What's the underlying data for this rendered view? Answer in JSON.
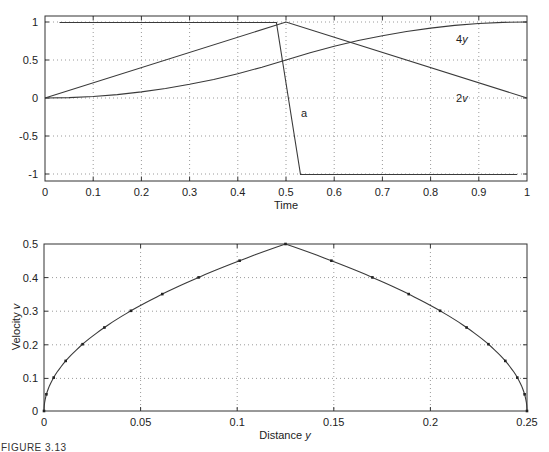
{
  "chart_data": [
    {
      "type": "line",
      "title": "",
      "xlabel": "Time",
      "ylabel": "",
      "xlim": [
        0,
        1
      ],
      "ylim": [
        -1.1,
        1.1
      ],
      "grid": true,
      "x_ticks": [
        "0",
        "0.1",
        "0.2",
        "0.3",
        "0.4",
        "0.5",
        "0.6",
        "0.7",
        "0.8",
        "0.9",
        "1"
      ],
      "y_ticks": [
        "1",
        "0.5",
        "0",
        "-0.5",
        "-1"
      ],
      "series": [
        {
          "name": "a",
          "x": [
            0.03,
            0.48,
            0.53,
            0.98
          ],
          "values": [
            1,
            1,
            -1,
            -1
          ]
        },
        {
          "name": "2v",
          "x": [
            0,
            0.5,
            1
          ],
          "values": [
            0,
            1,
            0
          ]
        },
        {
          "name": "4y",
          "x": [
            0,
            0.1,
            0.2,
            0.3,
            0.4,
            0.5,
            0.6,
            0.7,
            0.8,
            0.9,
            1
          ],
          "values": [
            0,
            0.02,
            0.08,
            0.18,
            0.32,
            0.5,
            0.68,
            0.82,
            0.92,
            0.98,
            1
          ]
        }
      ],
      "annotations": [
        {
          "text": "4y",
          "x": 0.88,
          "y": 0.8
        },
        {
          "text": "2v",
          "x": 0.88,
          "y": 0.05
        },
        {
          "text": "a",
          "x": 0.555,
          "y": -0.35
        }
      ]
    },
    {
      "type": "line",
      "title": "",
      "xlabel": "Distance y",
      "ylabel": "Velocity v",
      "xlim": [
        0,
        0.25
      ],
      "ylim": [
        0,
        0.5
      ],
      "grid": true,
      "markers": true,
      "x_ticks": [
        "0",
        "0.05",
        "0.1",
        "0.15",
        "0.2",
        "0.25"
      ],
      "y_ticks": [
        "0.5",
        "0.4",
        "0.3",
        "0.2",
        "0.1",
        "0"
      ],
      "series": [
        {
          "name": "velocity vs distance",
          "x": [
            0,
            0.00125,
            0.005,
            0.01125,
            0.02,
            0.03125,
            0.045,
            0.06125,
            0.08,
            0.10125,
            0.125,
            0.14875,
            0.17,
            0.18875,
            0.205,
            0.21875,
            0.23,
            0.23875,
            0.245,
            0.24875,
            0.25
          ],
          "values": [
            0,
            0.05,
            0.1,
            0.15,
            0.2,
            0.25,
            0.3,
            0.35,
            0.4,
            0.45,
            0.5,
            0.45,
            0.4,
            0.35,
            0.3,
            0.25,
            0.2,
            0.15,
            0.1,
            0.05,
            0
          ]
        }
      ]
    }
  ],
  "top_plot": {
    "xlabel": "Time",
    "x_ticks": [
      "0",
      "0.1",
      "0.2",
      "0.3",
      "0.4",
      "0.5",
      "0.6",
      "0.7",
      "0.8",
      "0.9",
      "1"
    ],
    "y_ticks": [
      "1",
      "0.5",
      "0",
      "-0.5",
      "-1"
    ],
    "annotations": {
      "four_y_num": "4",
      "four_y_var": "y",
      "two_v_num": "2",
      "two_v_var": "v",
      "a": "a"
    }
  },
  "bottom_plot": {
    "xlabel_text": "Distance ",
    "xlabel_var": "y",
    "ylabel_text": "Velocity ",
    "ylabel_var": "v",
    "x_ticks": [
      "0",
      "0.05",
      "0.1",
      "0.15",
      "0.2",
      "0.25"
    ],
    "y_ticks": [
      "0.5",
      "0.4",
      "0.3",
      "0.2",
      "0.1",
      "0"
    ]
  },
  "caption": "FIGURE 3.13"
}
